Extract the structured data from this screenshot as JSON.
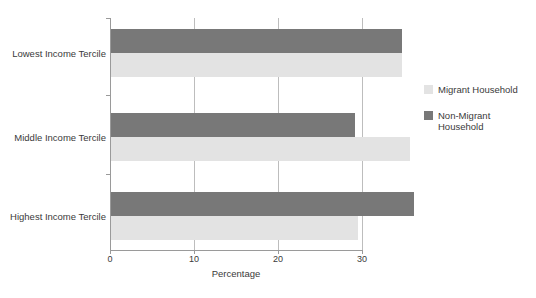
{
  "chart_data": {
    "type": "bar",
    "orientation": "horizontal",
    "title": "",
    "xlabel": "Percentage",
    "ylabel": "",
    "xlim": [
      0,
      30
    ],
    "x_ticks": [
      0,
      10,
      20,
      30
    ],
    "x_tick_labels": [
      "0",
      "10",
      "20",
      "30"
    ],
    "grid": "vertical",
    "legend_position": "right",
    "categories": [
      "Lowest Income Tercile",
      "Middle Income Tercile",
      "Highest Income Tercile"
    ],
    "series": [
      {
        "name": "Non-Migrant Household",
        "color": "#787878",
        "values": [
          34.8,
          29.2,
          36.2
        ]
      },
      {
        "name": "Migrant Household",
        "color": "#e3e3e3",
        "values": [
          34.8,
          35.7,
          29.5
        ]
      }
    ]
  },
  "legend": {
    "items": [
      {
        "label": "Migrant Household",
        "series": "light"
      },
      {
        "label": "Non-Migrant Household",
        "series": "dark"
      }
    ]
  }
}
